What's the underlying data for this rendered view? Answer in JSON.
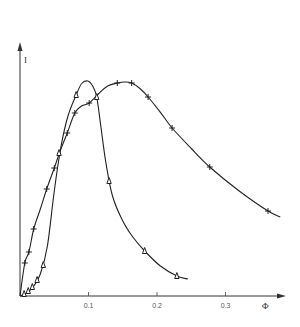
{
  "chart_data": {
    "type": "line",
    "title": "",
    "xlabel": "Φ",
    "ylabel": "I",
    "xlim": [
      0,
      0.38
    ],
    "ylim": [
      0,
      1.0
    ],
    "x_ticks": [
      0.1,
      0.2,
      0.3
    ],
    "x_tick_labels": [
      "0.1",
      "0.2",
      "0.3"
    ],
    "grid": false,
    "legend": "none",
    "series": [
      {
        "name": "triangle",
        "marker": "triangle",
        "points": [
          [
            0.006,
            0.008
          ],
          [
            0.012,
            0.02
          ],
          [
            0.018,
            0.036
          ],
          [
            0.025,
            0.064
          ],
          [
            0.034,
            0.124
          ],
          [
            0.057,
            0.572
          ],
          [
            0.082,
            0.804
          ],
          [
            0.112,
            0.796
          ],
          [
            0.13,
            0.46
          ],
          [
            0.182,
            0.18
          ],
          [
            0.229,
            0.08
          ]
        ],
        "curve": [
          [
            0.0,
            0.0
          ],
          [
            0.01,
            0.012
          ],
          [
            0.02,
            0.04
          ],
          [
            0.03,
            0.09
          ],
          [
            0.04,
            0.2
          ],
          [
            0.05,
            0.42
          ],
          [
            0.06,
            0.6
          ],
          [
            0.07,
            0.72
          ],
          [
            0.082,
            0.804
          ],
          [
            0.09,
            0.85
          ],
          [
            0.099,
            0.86
          ],
          [
            0.106,
            0.84
          ],
          [
            0.112,
            0.796
          ],
          [
            0.118,
            0.68
          ],
          [
            0.125,
            0.54
          ],
          [
            0.135,
            0.4
          ],
          [
            0.15,
            0.3
          ],
          [
            0.165,
            0.235
          ],
          [
            0.182,
            0.18
          ],
          [
            0.205,
            0.12
          ],
          [
            0.229,
            0.08
          ],
          [
            0.245,
            0.068
          ]
        ]
      },
      {
        "name": "plus",
        "marker": "plus",
        "points": [
          [
            0.007,
            0.132
          ],
          [
            0.013,
            0.176
          ],
          [
            0.02,
            0.268
          ],
          [
            0.039,
            0.428
          ],
          [
            0.05,
            0.512
          ],
          [
            0.069,
            0.652
          ],
          [
            0.08,
            0.732
          ],
          [
            0.101,
            0.772
          ],
          [
            0.142,
            0.852
          ],
          [
            0.163,
            0.852
          ],
          [
            0.187,
            0.796
          ],
          [
            0.222,
            0.672
          ],
          [
            0.277,
            0.516
          ],
          [
            0.362,
            0.34
          ]
        ],
        "curve": [
          [
            0.0,
            0.0
          ],
          [
            0.007,
            0.132
          ],
          [
            0.013,
            0.176
          ],
          [
            0.02,
            0.268
          ],
          [
            0.03,
            0.35
          ],
          [
            0.039,
            0.428
          ],
          [
            0.05,
            0.512
          ],
          [
            0.06,
            0.59
          ],
          [
            0.069,
            0.652
          ],
          [
            0.08,
            0.732
          ],
          [
            0.09,
            0.76
          ],
          [
            0.101,
            0.772
          ],
          [
            0.115,
            0.81
          ],
          [
            0.128,
            0.84
          ],
          [
            0.142,
            0.852
          ],
          [
            0.153,
            0.856
          ],
          [
            0.163,
            0.852
          ],
          [
            0.175,
            0.83
          ],
          [
            0.187,
            0.796
          ],
          [
            0.205,
            0.735
          ],
          [
            0.222,
            0.672
          ],
          [
            0.25,
            0.59
          ],
          [
            0.277,
            0.516
          ],
          [
            0.32,
            0.42
          ],
          [
            0.362,
            0.34
          ],
          [
            0.38,
            0.316
          ]
        ]
      }
    ]
  }
}
